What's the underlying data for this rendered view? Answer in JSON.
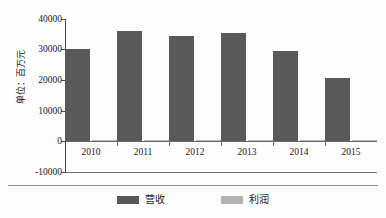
{
  "chart_data": {
    "type": "bar",
    "title": "",
    "subtitle": "",
    "xlabel": "",
    "ylabel": "单位：百万元",
    "categories": [
      "2010",
      "2011",
      "2012",
      "2013",
      "2014",
      "2015"
    ],
    "series": [
      {
        "name": "营收",
        "color": "#595959",
        "values": [
          30160,
          36170,
          34540,
          35290,
          29400,
          20680
        ]
      },
      {
        "name": "利润",
        "color": "#b3b3b3",
        "values": [
          260,
          300,
          240,
          200,
          150,
          120
        ]
      }
    ],
    "ylim": [
      -10000,
      40000
    ],
    "yticks": [
      40000,
      30000,
      20000,
      10000,
      0,
      -10000
    ],
    "ytick_labels": [
      "40000",
      "30000",
      "20000",
      "10000",
      "0",
      "-10000"
    ],
    "grid": false,
    "legend_position": "bottom",
    "legend_entries": [
      "营收",
      "利润"
    ],
    "axis_color": "#4a4a4a",
    "background_color": "#fdfdfd"
  },
  "axis": {
    "y_title": "单位：百万元",
    "y_ticks": [
      "40000",
      "30000",
      "20000",
      "10000",
      "0",
      "-10000"
    ],
    "x_ticks": [
      "2010",
      "2011",
      "2012",
      "2013",
      "2014",
      "2015"
    ]
  },
  "legend": {
    "revenue_label": "营收",
    "profit_label": "利润",
    "revenue_color": "#595959",
    "profit_color": "#b3b3b3"
  }
}
